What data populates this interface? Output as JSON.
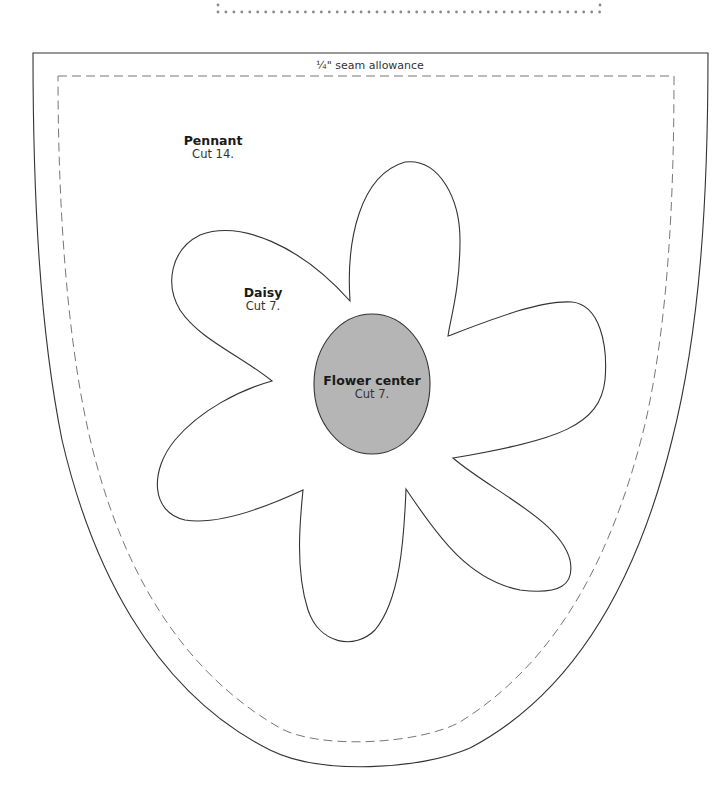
{
  "seam_allowance": {
    "label": "¼\" seam allowance"
  },
  "pieces": {
    "pennant": {
      "name": "Pennant",
      "instruction": "Cut 14."
    },
    "daisy": {
      "name": "Daisy",
      "instruction": "Cut 7."
    },
    "flower_center": {
      "name": "Flower center",
      "instruction": "Cut 7."
    }
  },
  "colors": {
    "outline": "#333333",
    "dashed_seam": "#777777",
    "flower_center_fill": "#b5b5b5",
    "dotted_rule": "#8a8a8a",
    "background": "#ffffff"
  }
}
